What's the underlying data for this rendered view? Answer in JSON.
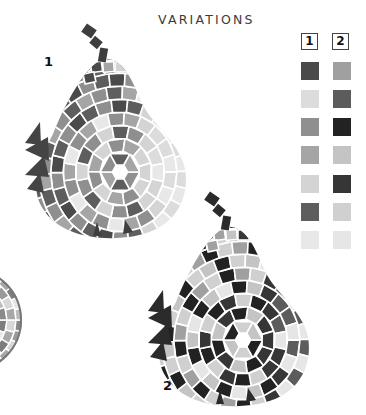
{
  "title": "VARIATIONS",
  "variants": [
    {
      "label": "1",
      "palette": [
        "#4a4a4a",
        "#dcdcdc",
        "#8f8f8f",
        "#a5a5a5",
        "#d4d4d4",
        "#5e5e5e",
        "#e8e8e8"
      ]
    },
    {
      "label": "2",
      "palette": [
        "#a0a0a0",
        "#5c5c5c",
        "#222222",
        "#c4c4c4",
        "#363636",
        "#d0d0d0",
        "#e6e6e6"
      ]
    }
  ],
  "legend": {
    "headers": [
      "1",
      "2"
    ]
  },
  "pears": [
    {
      "label": "1",
      "variant": 0,
      "x": 25,
      "y": 24
    },
    {
      "label": "2",
      "variant": 1,
      "x": 148,
      "y": 192
    }
  ]
}
